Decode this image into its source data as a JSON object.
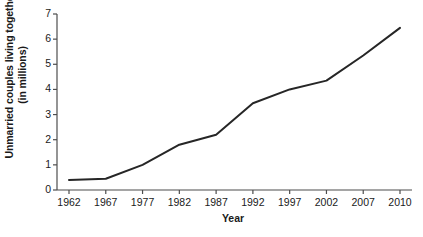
{
  "chart_data": {
    "type": "line",
    "title": "",
    "subtitle": "",
    "xlabel": "Year",
    "ylabel": "Unmarried couples living together (in millions)",
    "ylabel_lines": [
      "Unmarried couples living together",
      "(in millions)"
    ],
    "categories": [
      "1962",
      "1967",
      "1977",
      "1982",
      "1987",
      "1992",
      "1997",
      "2002",
      "2007",
      "2010"
    ],
    "values": [
      0.4,
      0.45,
      1.0,
      1.8,
      2.2,
      3.45,
      4.0,
      4.35,
      5.35,
      6.45
    ],
    "series": [
      {
        "name": "Unmarried couples living together",
        "values": [
          0.4,
          0.45,
          1.0,
          1.8,
          2.2,
          3.45,
          4.0,
          4.35,
          5.35,
          6.45
        ]
      }
    ],
    "y_ticks": [
      "0",
      "1",
      "2",
      "3",
      "4",
      "5",
      "6",
      "7"
    ],
    "y_tick_values": [
      0,
      1,
      2,
      3,
      4,
      5,
      6,
      7
    ],
    "ylim": [
      0,
      7
    ],
    "grid": false,
    "legend": false,
    "legend_position": "none",
    "markers": false,
    "line_color": "#262626",
    "background_color": "#ffffff",
    "axis_color": "#4d4d4d"
  }
}
